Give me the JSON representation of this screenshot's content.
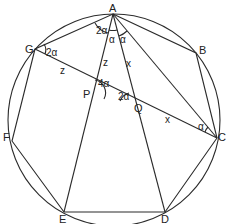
{
  "diagram": {
    "type": "geometry",
    "stroke_color": "#2b2b2b",
    "background": "#ffffff",
    "circle": {
      "cx": 114,
      "cy": 120,
      "r": 106
    },
    "vertices": {
      "A": {
        "label": "A",
        "x": 113,
        "y": 14
      },
      "B": {
        "label": "B",
        "x": 196,
        "y": 53
      },
      "C": {
        "label": "C",
        "x": 217,
        "y": 138
      },
      "D": {
        "label": "D",
        "x": 165,
        "y": 212
      },
      "E": {
        "label": "E",
        "x": 64,
        "y": 212
      },
      "F": {
        "label": "F",
        "x": 12,
        "y": 141
      },
      "G": {
        "label": "G",
        "x": 35,
        "y": 49
      }
    },
    "points": {
      "P": {
        "label": "P",
        "x": 92,
        "y": 93
      },
      "Q": {
        "label": "Q",
        "x": 133,
        "y": 107
      }
    },
    "angle_labels": [
      {
        "text": "2α",
        "at": "A (between AG and AE)"
      },
      {
        "text": "α",
        "at": "A (between AE and AD)"
      },
      {
        "text": "α",
        "at": "A (between AD and AC)"
      },
      {
        "text": "2α",
        "at": "G"
      },
      {
        "text": "4α",
        "at": "P"
      },
      {
        "text": "2α",
        "at": "Q"
      },
      {
        "text": "α",
        "at": "C"
      }
    ],
    "segment_labels": [
      {
        "text": "z",
        "on": "GP"
      },
      {
        "text": "z",
        "on": "AP"
      },
      {
        "text": "x",
        "on": "AQ"
      },
      {
        "text": "x",
        "on": "QC"
      }
    ]
  }
}
